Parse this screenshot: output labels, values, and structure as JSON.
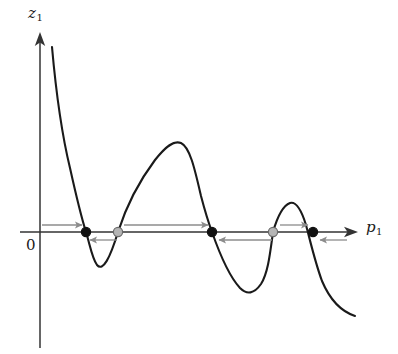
{
  "figure": {
    "title": "",
    "axes": {
      "y_axis_label": "z",
      "y_axis_subscript": "1",
      "x_axis_label": "p",
      "x_axis_subscript": "1",
      "origin_label": "0",
      "x_axis_y_pixel": 232,
      "y_axis_x_pixel": 40,
      "x_axis_start": 20,
      "x_axis_end": 358,
      "y_axis_top": 33,
      "y_axis_bottom": 348,
      "axis_color": "#333333"
    },
    "curve": {
      "color": "#1a1a1a",
      "stroke_width": 2.1,
      "path": "M 52,47 C 56,92 62,135 70,168 C 76,195 80,213 86,232 C 90,245 92,258 97,265 C 103,272 110,258 118,232 C 126,207 140,180 155,160 C 166,146 174,140 181,143 C 190,147 195,170 201,196 C 206,215 209,224 212,232 C 219,252 228,275 240,288 C 247,295 254,294 261,284 C 268,273 270,254 273,232 C 277,218 282,206 290,203 C 297,201 302,212 306,225 C 310,240 315,262 322,281 C 330,300 340,311 355,316"
    },
    "equilibria": [
      {
        "id": "eq-1",
        "type": "stable",
        "x": 86,
        "y": 232,
        "fill": "#111111",
        "stroke": "#111111",
        "radius": 4.6
      },
      {
        "id": "eq-2",
        "type": "unstable",
        "x": 118,
        "y": 232,
        "fill": "#b5b5b5",
        "stroke": "#6a6a6a",
        "radius": 4.6
      },
      {
        "id": "eq-3",
        "type": "stable",
        "x": 212,
        "y": 232,
        "fill": "#111111",
        "stroke": "#111111",
        "radius": 4.6
      },
      {
        "id": "eq-4",
        "type": "unstable",
        "x": 273,
        "y": 232,
        "fill": "#b5b5b5",
        "stroke": "#6a6a6a",
        "radius": 4.6
      },
      {
        "id": "eq-5",
        "type": "stable",
        "x": 313,
        "y": 232,
        "fill": "#111111",
        "stroke": "#111111",
        "radius": 4.6
      }
    ],
    "flow_arrows": [
      {
        "id": "arrow-1",
        "direction": "right",
        "y": 225,
        "x_start": 42,
        "x_end": 82,
        "color": "#8c8c8c"
      },
      {
        "id": "arrow-2",
        "direction": "left",
        "y": 240,
        "x_start": 117,
        "x_end": 90,
        "color": "#8c8c8c"
      },
      {
        "id": "arrow-3",
        "direction": "right",
        "y": 225,
        "x_start": 124,
        "x_end": 208,
        "color": "#8c8c8c"
      },
      {
        "id": "arrow-4",
        "direction": "left",
        "y": 240,
        "x_start": 272,
        "x_end": 219,
        "color": "#8c8c8c"
      },
      {
        "id": "arrow-5",
        "direction": "right",
        "y": 225,
        "x_start": 280,
        "x_end": 308,
        "color": "#8c8c8c"
      },
      {
        "id": "arrow-6",
        "direction": "left",
        "y": 240,
        "x_start": 347,
        "x_end": 320,
        "color": "#8c8c8c"
      }
    ]
  },
  "chart_data": {
    "type": "line",
    "title": "",
    "xlabel": "p1",
    "ylabel": "z1",
    "grid": false,
    "legend": null,
    "annotations": [
      "0 marks the origin on the p1 axis",
      "Filled black circles denote stable equilibria (arrows point toward them)",
      "Open gray circles denote unstable equilibria (arrows point away from them)"
    ],
    "series": [
      {
        "name": "z1(p1)",
        "description": "Oscillating curve with decaying amplitude crossing zero five times",
        "x": [
          52,
          70,
          86,
          97,
          118,
          142,
          181,
          212,
          250,
          273,
          292,
          313,
          355
        ],
        "y": [
          185,
          64,
          0,
          -33,
          0,
          52,
          89,
          0,
          -59,
          0,
          29,
          0,
          -84
        ],
        "feature": [
          "start-high",
          "steep-descent",
          "zero-crossing-1",
          "local-min-1",
          "zero-crossing-2",
          "rising",
          "local-max-1",
          "zero-crossing-3",
          "local-min-2",
          "zero-crossing-4",
          "local-max-2",
          "zero-crossing-5",
          "end-low"
        ]
      }
    ],
    "zero_crossings": [
      {
        "index": 1,
        "stability": "stable"
      },
      {
        "index": 2,
        "stability": "unstable"
      },
      {
        "index": 3,
        "stability": "stable"
      },
      {
        "index": 4,
        "stability": "unstable"
      },
      {
        "index": 5,
        "stability": "stable"
      }
    ],
    "xlim": [
      40,
      358
    ],
    "ylim": [
      -120,
      200
    ]
  }
}
